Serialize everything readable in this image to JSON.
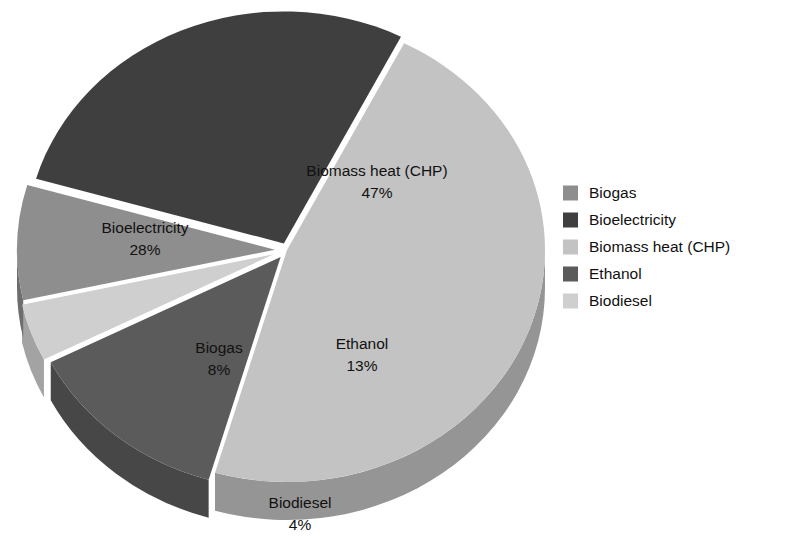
{
  "chart_data": {
    "type": "pie",
    "title": "",
    "subtitle": "",
    "xlabel": "",
    "ylabel": "",
    "style": "3d-exploded-pie",
    "grid": false,
    "legend_position": "right",
    "units": "percent",
    "total": 100,
    "categories": [
      "Biogas",
      "Bioelectricity",
      "Biomass heat (CHP)",
      "Ethanol",
      "Biodiesel"
    ],
    "values": [
      8,
      28,
      47,
      13,
      4
    ],
    "value_labels": [
      "8%",
      "28%",
      "47%",
      "13%",
      "4%"
    ],
    "colors": [
      "#8e8e8e",
      "#3f3f3f",
      "#c3c3c3",
      "#5b5b5b",
      "#cfcfcf"
    ],
    "side_colors": [
      "#6d6d6d",
      "#2f2f2f",
      "#959595",
      "#474747",
      "#a3a3a3"
    ],
    "slices": [
      {
        "name": "Biomass heat (CHP)",
        "value": 47,
        "percent_label": "47%",
        "color": "#c3c3c3",
        "side_color": "#959595",
        "label_x": 377,
        "label_y": 176,
        "value_x": 377,
        "value_y": 198
      },
      {
        "name": "Ethanol",
        "value": 13,
        "percent_label": "13%",
        "color": "#5b5b5b",
        "side_color": "#474747",
        "label_x": 362,
        "label_y": 349,
        "value_x": 362,
        "value_y": 371
      },
      {
        "name": "Biodiesel",
        "value": 4,
        "percent_label": "4%",
        "color": "#cfcfcf",
        "side_color": "#a3a3a3",
        "label_x": 300,
        "label_y": 508,
        "value_x": 300,
        "value_y": 530
      },
      {
        "name": "Biogas",
        "value": 8,
        "percent_label": "8%",
        "color": "#8e8e8e",
        "side_color": "#6d6d6d",
        "label_x": 219,
        "label_y": 353,
        "value_x": 219,
        "value_y": 375
      },
      {
        "name": "Bioelectricity",
        "value": 28,
        "percent_label": "28%",
        "color": "#3f3f3f",
        "side_color": "#2f2f2f",
        "label_x": 145,
        "label_y": 233,
        "value_x": 145,
        "value_y": 255
      }
    ]
  },
  "legend": {
    "items": [
      {
        "label": "Biogas",
        "color": "#8e8e8e"
      },
      {
        "label": "Bioelectricity",
        "color": "#3f3f3f"
      },
      {
        "label": "Biomass heat (CHP)",
        "color": "#c3c3c3"
      },
      {
        "label": "Ethanol",
        "color": "#5b5b5b"
      },
      {
        "label": "Biodiesel",
        "color": "#cfcfcf"
      }
    ]
  },
  "geometry": {
    "cx": 287,
    "cy": 250,
    "rx": 258,
    "ry": 232,
    "depth": 38,
    "start_angle_deg": -63
  }
}
